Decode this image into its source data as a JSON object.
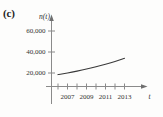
{
  "figure": {
    "panel_label": "(c)",
    "y_axis_name": "n(t)",
    "x_axis_name": "t"
  },
  "chart_data": {
    "type": "line",
    "title": "",
    "subtitle": "",
    "xlabel": "t",
    "ylabel": "n(t)",
    "x": [
      2006,
      2007,
      2008,
      2009,
      2010,
      2011,
      2012,
      2013
    ],
    "values": [
      18500,
      20000,
      21800,
      23800,
      26000,
      28400,
      31000,
      34000
    ],
    "series": [
      {
        "name": "n(t)",
        "values": [
          18500,
          20000,
          21800,
          23800,
          26000,
          28400,
          31000,
          34000
        ]
      }
    ],
    "x_tick_labels": [
      "2007",
      "2009",
      "2011",
      "2013"
    ],
    "x_tick_values": [
      2007,
      2009,
      2011,
      2013
    ],
    "x_minor_tick_values": [
      2006,
      2008,
      2010,
      2012
    ],
    "y_tick_labels": [
      "20,000",
      "40,000",
      "60,000"
    ],
    "y_tick_values": [
      20000,
      40000,
      60000
    ],
    "xlim": [
      2005.4,
      2014.6
    ],
    "ylim": [
      0,
      68000
    ],
    "grid": false,
    "legend": "none",
    "curve_color": "#3a3a3a",
    "axis_color": "#8a8a8a"
  },
  "labels": {
    "y_tick_60000": "60,000",
    "y_tick_40000": "40,000",
    "y_tick_20000": "20,000",
    "x_tick_2007": "2007",
    "x_tick_2009": "2009",
    "x_tick_2011": "2011",
    "x_tick_2013": "2013"
  }
}
